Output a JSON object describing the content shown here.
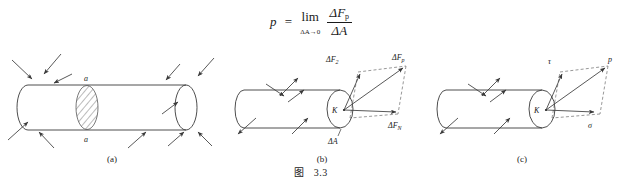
{
  "formula": {
    "variable": "p",
    "equals": "=",
    "limit_op": "lim",
    "limit_sub": "ΔA→0",
    "numerator": "ΔF",
    "numerator_sub": "p",
    "denominator": "ΔA"
  },
  "panels": [
    {
      "id": "a",
      "caption": "(a)",
      "labels": {
        "top": "a",
        "bottom": "a"
      }
    },
    {
      "id": "b",
      "caption": "(b)",
      "labels": {
        "point": "K",
        "area": "ΔA",
        "force_total": "ΔF",
        "force_total_sub": "2",
        "force_parallel": "ΔF",
        "force_parallel_sub": "p",
        "force_normal": "ΔF",
        "force_normal_sub": "N"
      }
    },
    {
      "id": "c",
      "caption": "(c)",
      "labels": {
        "point": "K",
        "shear": "τ",
        "resultant": "p",
        "normal": "σ"
      }
    }
  ],
  "figure_caption": {
    "prefix": "图",
    "number": "3.3"
  },
  "colors": {
    "ink": "#1a1a1a",
    "line": "#3a3a3a",
    "hatch": "#555555",
    "dashed": "#6b6b6b",
    "background": "#ffffff"
  }
}
